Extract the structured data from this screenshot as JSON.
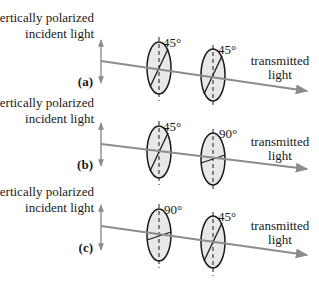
{
  "diagram": {
    "incident_label_line1": "vertically polarized",
    "incident_label_line2": "incident light",
    "transmitted_label_line1": "transmitted",
    "transmitted_label_line2": "light",
    "colors": {
      "beam": "#8c8c8c",
      "filter_fill": "#e8e8e8",
      "outline": "#1a1a1a"
    },
    "panels": [
      {
        "tag": "(a)",
        "filter1_angle_label": "45°",
        "filter1_angle_deg": 45,
        "filter2_angle_label": "45°",
        "filter2_angle_deg": 45
      },
      {
        "tag": "(b)",
        "filter1_angle_label": "45°",
        "filter1_angle_deg": 45,
        "filter2_angle_label": "90°",
        "filter2_angle_deg": 90
      },
      {
        "tag": "(c)",
        "filter1_angle_label": "90°",
        "filter1_angle_deg": 90,
        "filter2_angle_label": "45°",
        "filter2_angle_deg": 45
      }
    ]
  }
}
